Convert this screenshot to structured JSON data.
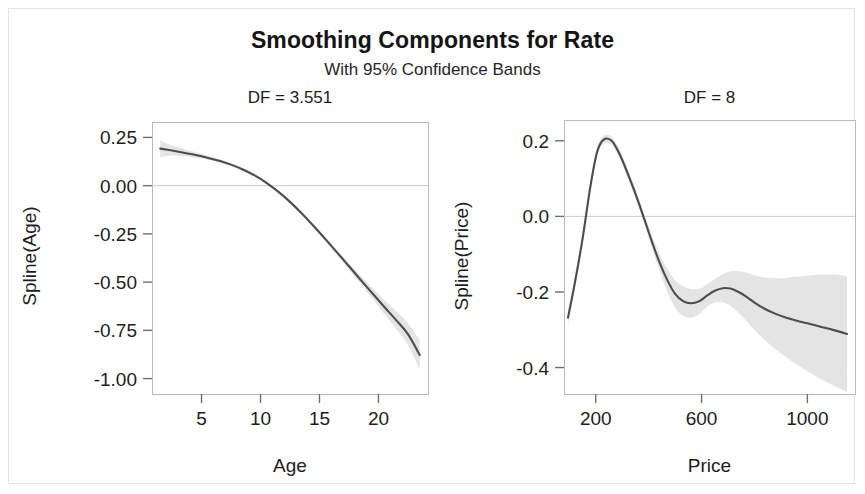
{
  "figure": {
    "title": "Smoothing Components for Rate",
    "subtitle": "With 95% Confidence Bands",
    "background": "#ffffff",
    "curve_color": "#4d4d4d",
    "band_color": "#bfbfbf",
    "frame_color": "#b9b9b9",
    "reference_line_color": "#c9c9c9"
  },
  "chart_data": [
    {
      "type": "line",
      "panel": "left",
      "title": "DF = 3.551",
      "xlabel": "Age",
      "ylabel": "Spline(Age)",
      "xlim": [
        0.8,
        24.2
      ],
      "ylim": [
        -1.08,
        0.33
      ],
      "xticks": [
        5,
        10,
        15,
        20
      ],
      "xticklabels": [
        "5",
        "10",
        "15",
        "20"
      ],
      "yticks": [
        0.25,
        0,
        -0.25,
        -0.5,
        -0.75,
        -1
      ],
      "yticklabels": [
        "0.25",
        "0.00",
        "-0.25",
        "-0.50",
        "-0.75",
        "-1.00"
      ],
      "grid": false,
      "reference_line_y": 0.0,
      "legend": "none",
      "series": [
        {
          "name": "Spline(Age)",
          "x": [
            1.5,
            2.5,
            3.5,
            4.5,
            5.5,
            6.5,
            7.5,
            8.5,
            9.5,
            10.5,
            11.5,
            12.5,
            13.5,
            14.5,
            15.5,
            16.5,
            17.5,
            18.5,
            19.5,
            20.5,
            21.5,
            22.5,
            23.5
          ],
          "values": [
            0.192,
            0.182,
            0.171,
            0.159,
            0.145,
            0.129,
            0.109,
            0.084,
            0.053,
            0.015,
            -0.031,
            -0.084,
            -0.144,
            -0.209,
            -0.277,
            -0.347,
            -0.418,
            -0.489,
            -0.559,
            -0.629,
            -0.697,
            -0.77,
            -0.878
          ],
          "lower": [
            0.148,
            0.156,
            0.152,
            0.145,
            0.134,
            0.12,
            0.101,
            0.077,
            0.047,
            0.009,
            -0.037,
            -0.09,
            -0.151,
            -0.217,
            -0.287,
            -0.359,
            -0.434,
            -0.51,
            -0.587,
            -0.665,
            -0.743,
            -0.827,
            -0.952
          ],
          "upper": [
            0.235,
            0.208,
            0.19,
            0.173,
            0.156,
            0.138,
            0.117,
            0.091,
            0.059,
            0.021,
            -0.025,
            -0.078,
            -0.137,
            -0.201,
            -0.267,
            -0.335,
            -0.402,
            -0.468,
            -0.531,
            -0.593,
            -0.651,
            -0.713,
            -0.804
          ]
        }
      ]
    },
    {
      "type": "line",
      "panel": "right",
      "title": "DF = 8",
      "xlabel": "Price",
      "ylabel": "Spline(Price)",
      "xlim": [
        80,
        1180
      ],
      "ylim": [
        -0.47,
        0.255
      ],
      "xticks": [
        200,
        600,
        1000
      ],
      "xticklabels": [
        "200",
        "600",
        "1000"
      ],
      "yticks": [
        0.2,
        0,
        -0.2,
        -0.4
      ],
      "yticklabels": [
        "0.2",
        "0.0",
        "-0.2",
        "-0.4"
      ],
      "grid": false,
      "reference_line_y": 0.0,
      "legend": "none",
      "series": [
        {
          "name": "Spline(Price)",
          "x": [
            95,
            120,
            150,
            180,
            205,
            230,
            260,
            290,
            320,
            350,
            380,
            410,
            440,
            470,
            500,
            530,
            560,
            590,
            620,
            650,
            680,
            710,
            740,
            770,
            800,
            840,
            880,
            920,
            960,
            1000,
            1050,
            1100,
            1150
          ],
          "values": [
            -0.268,
            -0.18,
            -0.06,
            0.08,
            0.17,
            0.203,
            0.2,
            0.165,
            0.115,
            0.06,
            0.0,
            -0.062,
            -0.12,
            -0.168,
            -0.205,
            -0.224,
            -0.23,
            -0.225,
            -0.21,
            -0.197,
            -0.19,
            -0.191,
            -0.2,
            -0.213,
            -0.228,
            -0.245,
            -0.258,
            -0.268,
            -0.276,
            -0.283,
            -0.292,
            -0.301,
            -0.311
          ],
          "lower": [
            -0.285,
            -0.196,
            -0.074,
            0.068,
            0.159,
            0.192,
            0.189,
            0.153,
            0.103,
            0.047,
            -0.013,
            -0.078,
            -0.142,
            -0.198,
            -0.241,
            -0.263,
            -0.268,
            -0.259,
            -0.24,
            -0.228,
            -0.227,
            -0.237,
            -0.255,
            -0.277,
            -0.3,
            -0.328,
            -0.352,
            -0.373,
            -0.392,
            -0.409,
            -0.43,
            -0.448,
            -0.464
          ],
          "upper": [
            -0.251,
            -0.164,
            -0.046,
            0.092,
            0.181,
            0.214,
            0.211,
            0.177,
            0.127,
            0.073,
            0.013,
            -0.046,
            -0.098,
            -0.138,
            -0.169,
            -0.185,
            -0.192,
            -0.191,
            -0.18,
            -0.166,
            -0.153,
            -0.145,
            -0.145,
            -0.149,
            -0.156,
            -0.162,
            -0.164,
            -0.163,
            -0.16,
            -0.157,
            -0.154,
            -0.154,
            -0.158
          ]
        }
      ]
    }
  ],
  "panels_geometry": {
    "left": {
      "x": 152,
      "y": 122,
      "w": 276,
      "h": 272
    },
    "right": {
      "x": 564,
      "y": 120,
      "w": 291,
      "h": 274
    }
  }
}
